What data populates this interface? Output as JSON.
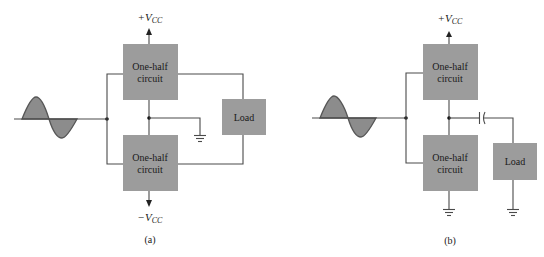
{
  "diagram": {
    "colors": {
      "block_fill": "#9c9c9c",
      "wire": "#4a4a4a",
      "sine_fill": "#8c8c8c"
    },
    "panel_a": {
      "caption": "(a)",
      "top_block": {
        "line1": "One-half",
        "line2": "circuit"
      },
      "bottom_block": {
        "line1": "One-half",
        "line2": "circuit"
      },
      "load_block": {
        "label": "Load"
      },
      "supply_top": {
        "sign": "+V",
        "sub": "CC"
      },
      "supply_bottom": {
        "sign": "−V",
        "sub": "CC"
      },
      "input_signal": "sine-wave",
      "ground_symbols": 1
    },
    "panel_b": {
      "caption": "(b)",
      "top_block": {
        "line1": "One-half",
        "line2": "circuit"
      },
      "bottom_block": {
        "line1": "One-half",
        "line2": "circuit"
      },
      "load_block": {
        "label": "Load"
      },
      "supply_top": {
        "sign": "+V",
        "sub": "CC"
      },
      "input_signal": "sine-wave",
      "coupling": "capacitor",
      "ground_symbols": 2
    }
  }
}
